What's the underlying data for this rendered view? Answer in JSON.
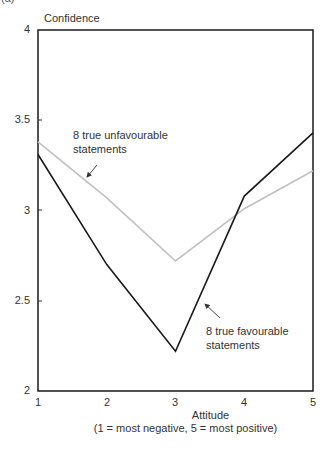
{
  "figure": {
    "panel_label": "(a)"
  },
  "chart_data": {
    "type": "line",
    "title": "",
    "xlabel": "Attitude",
    "xlabel_sub": "(1 = most negative, 5 = most positive)",
    "ylabel": "Confidence",
    "x": [
      1,
      2,
      3,
      4,
      5
    ],
    "xlim": [
      1,
      5
    ],
    "ylim": [
      2,
      4
    ],
    "yticks": [
      "2",
      "2.5",
      "3",
      "3.5",
      "4"
    ],
    "xticks": [
      "1",
      "2",
      "3",
      "4",
      "5"
    ],
    "grid": false,
    "legend": "none (inline annotations)",
    "series": [
      {
        "name": "8 true unfavourable statements",
        "color": "#c0c0c0",
        "values": [
          3.38,
          3.07,
          2.72,
          3.01,
          3.22
        ]
      },
      {
        "name": "8 true favourable statements",
        "color": "#1a1a1a",
        "values": [
          3.31,
          2.7,
          2.22,
          3.08,
          3.43
        ]
      }
    ],
    "annotations": [
      {
        "text_line1": "8 true unfavourable",
        "text_line2": "statements",
        "target_series": "8 true unfavourable statements"
      },
      {
        "text_line1": "8 true favourable",
        "text_line2": "statements",
        "target_series": "8 true favourable statements"
      }
    ]
  }
}
